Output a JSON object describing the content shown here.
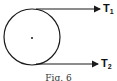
{
  "diagram": {
    "type": "pulley-belt-tension",
    "circle": {
      "cx": 32,
      "cy": 37,
      "r": 28,
      "stroke": "#1a1a1a"
    },
    "center_dot": {
      "cx": 32,
      "cy": 38
    },
    "tensions": [
      {
        "label_main": "T",
        "label_sub": "1",
        "y": 9
      },
      {
        "label_main": "T",
        "label_sub": "2",
        "y": 64
      }
    ],
    "caption": "Fig. 6"
  }
}
